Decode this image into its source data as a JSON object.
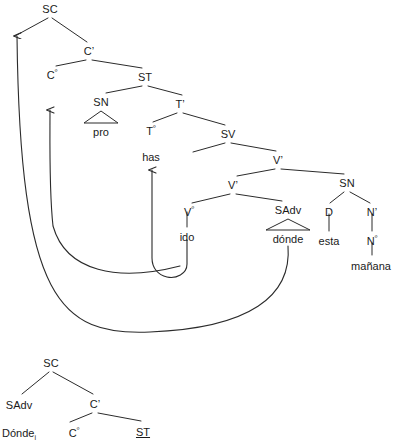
{
  "diagram": {
    "type": "syntax-tree",
    "line_color": "#2b2b2b",
    "text_color": "#1a1a1a"
  },
  "main_tree": {
    "nodes": [
      {
        "id": "sc",
        "label": "SC",
        "x": 50,
        "y": 4,
        "kind": "phrase"
      },
      {
        "id": "cbar",
        "label": "C’",
        "x": 89,
        "y": 46,
        "kind": "phrase"
      },
      {
        "id": "c0",
        "label": "C",
        "sup": "º",
        "x": 52,
        "y": 70,
        "kind": "head"
      },
      {
        "id": "st",
        "label": "ST",
        "x": 145,
        "y": 72,
        "kind": "phrase"
      },
      {
        "id": "sn1",
        "label": "SN",
        "x": 101,
        "y": 97,
        "kind": "phrase"
      },
      {
        "id": "tbar",
        "label": "T’",
        "x": 180,
        "y": 99,
        "kind": "phrase"
      },
      {
        "id": "pro",
        "label": "pro",
        "x": 101,
        "y": 127,
        "kind": "terminal"
      },
      {
        "id": "t0",
        "label": "T",
        "sup": "º",
        "x": 151,
        "y": 126,
        "kind": "head"
      },
      {
        "id": "sv",
        "label": "SV",
        "x": 228,
        "y": 129,
        "kind": "phrase"
      },
      {
        "id": "has",
        "label": "has",
        "x": 151,
        "y": 152,
        "kind": "terminal"
      },
      {
        "id": "vbar1",
        "label": "V’",
        "x": 278,
        "y": 155,
        "kind": "phrase"
      },
      {
        "id": "vbar2",
        "label": "V’",
        "x": 233,
        "y": 180,
        "kind": "phrase"
      },
      {
        "id": "sn2",
        "label": "SN",
        "x": 347,
        "y": 178,
        "kind": "phrase"
      },
      {
        "id": "v0",
        "label": "V",
        "sup": "º",
        "x": 189,
        "y": 207,
        "kind": "head"
      },
      {
        "id": "sadv",
        "label": "SAdv",
        "x": 288,
        "y": 205,
        "kind": "phrase"
      },
      {
        "id": "d",
        "label": "D",
        "x": 329,
        "y": 207,
        "kind": "head"
      },
      {
        "id": "nbar",
        "label": "N’",
        "x": 372,
        "y": 207,
        "kind": "phrase"
      },
      {
        "id": "ido",
        "label": "ido",
        "x": 187,
        "y": 232,
        "kind": "terminal"
      },
      {
        "id": "donde",
        "label": "dónde",
        "x": 288,
        "y": 234,
        "kind": "terminal"
      },
      {
        "id": "esta",
        "label": "esta",
        "x": 329,
        "y": 236,
        "kind": "terminal"
      },
      {
        "id": "n0",
        "label": "N",
        "sup": "º",
        "x": 372,
        "y": 236,
        "kind": "head"
      },
      {
        "id": "manana",
        "label": "mañana",
        "x": 371,
        "y": 261,
        "kind": "terminal"
      }
    ],
    "branches": [
      {
        "from": "sc-left",
        "x1": 48,
        "y1": 18,
        "x2": 15,
        "y2": 36
      },
      {
        "from": "sc-right",
        "x1": 52,
        "y1": 18,
        "x2": 87,
        "y2": 42
      },
      {
        "from": "cbar-left",
        "x1": 86,
        "y1": 60,
        "x2": 56,
        "y2": 66
      },
      {
        "from": "cbar-right",
        "x1": 92,
        "y1": 60,
        "x2": 142,
        "y2": 68
      },
      {
        "from": "st-left",
        "x1": 142,
        "y1": 86,
        "x2": 106,
        "y2": 93
      },
      {
        "from": "st-right",
        "x1": 148,
        "y1": 86,
        "x2": 182,
        "y2": 95
      },
      {
        "from": "tbar-left",
        "x1": 177,
        "y1": 113,
        "x2": 153,
        "y2": 122
      },
      {
        "from": "tbar-right",
        "x1": 183,
        "y1": 113,
        "x2": 225,
        "y2": 125
      },
      {
        "from": "sv-left",
        "x1": 225,
        "y1": 143,
        "x2": 193,
        "y2": 152
      },
      {
        "from": "sv-right",
        "x1": 231,
        "y1": 143,
        "x2": 276,
        "y2": 151
      },
      {
        "from": "vbar1-left",
        "x1": 275,
        "y1": 169,
        "x2": 237,
        "y2": 176
      },
      {
        "from": "vbar1-right",
        "x1": 281,
        "y1": 169,
        "x2": 344,
        "y2": 174
      },
      {
        "from": "vbar2-left",
        "x1": 230,
        "y1": 194,
        "x2": 192,
        "y2": 203
      },
      {
        "from": "vbar2-right",
        "x1": 236,
        "y1": 194,
        "x2": 282,
        "y2": 201
      },
      {
        "from": "sn2-left",
        "x1": 344,
        "y1": 192,
        "x2": 330,
        "y2": 203
      },
      {
        "from": "sn2-right",
        "x1": 350,
        "y1": 192,
        "x2": 370,
        "y2": 203
      },
      {
        "from": "v0-stem",
        "x1": 187,
        "y1": 212,
        "x2": 187,
        "y2": 227
      },
      {
        "from": "d-stem",
        "x1": 329,
        "y1": 214,
        "x2": 329,
        "y2": 231
      },
      {
        "from": "nbar-stem",
        "x1": 372,
        "y1": 214,
        "x2": 372,
        "y2": 231
      },
      {
        "from": "n0-stem",
        "x1": 372,
        "y1": 243,
        "x2": 372,
        "y2": 255
      }
    ],
    "triangles": [
      {
        "name": "sn-pro-triangle",
        "apex_x": 101,
        "apex_y": 111,
        "left_x": 84,
        "right_x": 118,
        "base_y": 123
      },
      {
        "name": "sadv-donde-triangle",
        "apex_x": 288,
        "apex_y": 219,
        "left_x": 266,
        "right_x": 310,
        "base_y": 230
      }
    ]
  },
  "lower_tree": {
    "nodes": [
      {
        "id": "sc2",
        "label": "SC",
        "x": 51,
        "y": 358,
        "kind": "phrase"
      },
      {
        "id": "sadv2",
        "label": "SAdv",
        "x": 19,
        "y": 400,
        "kind": "phrase"
      },
      {
        "id": "cbar2",
        "label": "C’",
        "x": 95,
        "y": 399,
        "kind": "phrase"
      },
      {
        "id": "donde2",
        "label": "Dónde",
        "sub": "i",
        "x": 19,
        "y": 428,
        "kind": "terminal"
      },
      {
        "id": "c02",
        "label": "C",
        "sup": "º",
        "x": 74,
        "y": 428,
        "kind": "head"
      },
      {
        "id": "st2",
        "label": "ST",
        "x": 143,
        "y": 427,
        "kind": "struck"
      }
    ],
    "branches": [
      {
        "from": "sc2-left",
        "x1": 49,
        "y1": 372,
        "x2": 22,
        "y2": 394
      },
      {
        "from": "sc2-right",
        "x1": 53,
        "y1": 372,
        "x2": 93,
        "y2": 394
      },
      {
        "from": "cbar2-left",
        "x1": 92,
        "y1": 413,
        "x2": 70,
        "y2": 422
      },
      {
        "from": "cbar2-right",
        "x1": 98,
        "y1": 413,
        "x2": 141,
        "y2": 421
      }
    ]
  },
  "movement_arrows": [
    {
      "name": "donde-to-spec-sc-arrow",
      "description": "long movement of dónde to specifier of SC",
      "path": "M 288 246 C 291 300, 250 330, 150 333 C 60 335, 22 300, 17 240",
      "arrowhead": {
        "x": 17,
        "y": 30,
        "direction": "up"
      },
      "full_path": "M 288 246 C 292 296, 250 328, 150 332 C 60 336, 20 300, 17 36"
    },
    {
      "name": "pro-to-spec-st-arrow",
      "description": "movement of subject pro to specifier of ST",
      "path": "M 180 265 C 120 282, 68 272, 54 228 C 50 200, 50 150, 50 110",
      "arrowhead": {
        "x": 50,
        "y": 106,
        "direction": "up"
      },
      "full_path": "M 180 266 C 118 282, 66 272, 53 226 C 49 190, 50 140, 50 110"
    },
    {
      "name": "ido-to-t-head-arrow",
      "description": "verb head movement of ido to Tº (has)",
      "path": "M 187 240 C 187 270, 150 276, 148 258 C 148 230, 150 200, 150 170",
      "arrowhead": {
        "x": 150,
        "y": 166,
        "direction": "up"
      },
      "full_path": "M 187 240 L 187 264 C 187 274, 176 279, 167 277 C 158 275, 152 268, 152 258 L 152 170"
    }
  ]
}
